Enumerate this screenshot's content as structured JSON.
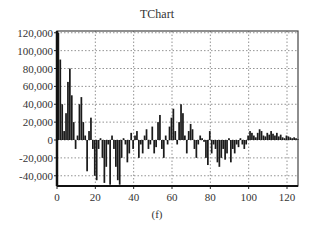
{
  "chart_data": {
    "type": "bar",
    "title": "TChart",
    "caption": "(f)",
    "xlabel": "",
    "ylabel": "",
    "xlim": [
      0,
      126
    ],
    "ylim": [
      -50000,
      120000
    ],
    "x_ticks": [
      0,
      20,
      40,
      60,
      80,
      100,
      120
    ],
    "y_ticks": [
      120000,
      100000,
      80000,
      60000,
      40000,
      20000,
      0,
      -20000,
      -40000
    ],
    "y_tick_labels": [
      "120,000",
      "100,000",
      "80,000",
      "60,000",
      "40,000",
      "20,000",
      "0",
      "-20,000",
      "-40,000"
    ],
    "grid": true,
    "grid_style": "dotted",
    "legend": null,
    "bar_color": "#1a1a1a",
    "x": [
      0,
      1,
      2,
      3,
      4,
      5,
      6,
      7,
      8,
      9,
      10,
      11,
      12,
      13,
      14,
      15,
      16,
      17,
      18,
      19,
      20,
      21,
      22,
      23,
      24,
      25,
      26,
      27,
      28,
      29,
      30,
      31,
      32,
      33,
      34,
      35,
      36,
      37,
      38,
      39,
      40,
      41,
      42,
      43,
      44,
      45,
      46,
      47,
      48,
      49,
      50,
      51,
      52,
      53,
      54,
      55,
      56,
      57,
      58,
      59,
      60,
      61,
      62,
      63,
      64,
      65,
      66,
      67,
      68,
      69,
      70,
      71,
      72,
      73,
      74,
      75,
      76,
      77,
      78,
      79,
      80,
      81,
      82,
      83,
      84,
      85,
      86,
      87,
      88,
      89,
      90,
      91,
      92,
      93,
      94,
      95,
      96,
      97,
      98,
      99,
      100,
      101,
      102,
      103,
      104,
      105,
      106,
      107,
      108,
      109,
      110,
      111,
      112,
      113,
      114,
      115,
      116,
      117,
      118,
      119,
      120,
      121,
      122,
      123,
      124,
      125
    ],
    "values": [
      120000,
      90000,
      40000,
      10000,
      30000,
      65000,
      80000,
      50000,
      20000,
      -10000,
      5000,
      40000,
      48000,
      20000,
      5000,
      -35000,
      10000,
      25000,
      -10000,
      -40000,
      -45000,
      -10000,
      2000,
      -20000,
      -48000,
      -30000,
      -5000,
      -50000,
      5000,
      -10000,
      -30000,
      -45000,
      -50000,
      -20000,
      2000,
      -5000,
      -25000,
      -15000,
      8000,
      -10000,
      5000,
      10000,
      -20000,
      -5000,
      -15000,
      5000,
      12000,
      -10000,
      -5000,
      15000,
      -15000,
      -8000,
      20000,
      28000,
      -10000,
      -20000,
      5000,
      -5000,
      15000,
      25000,
      35000,
      10000,
      -5000,
      20000,
      40000,
      30000,
      5000,
      -15000,
      10000,
      18000,
      12000,
      -10000,
      -20000,
      -5000,
      5000,
      2000,
      -2000,
      -20000,
      -28000,
      10000,
      -15000,
      -5000,
      -10000,
      -25000,
      -30000,
      -20000,
      -10000,
      -22000,
      -15000,
      2000,
      -25000,
      -10000,
      -15000,
      -5000,
      -8000,
      2000,
      -5000,
      -10000,
      -5000,
      5000,
      10000,
      8000,
      5000,
      3000,
      8000,
      12000,
      10000,
      5000,
      4000,
      8000,
      6000,
      10000,
      7000,
      5000,
      8000,
      4000,
      6000,
      3000,
      2000,
      5000,
      4000,
      3000,
      2000,
      3000,
      2000,
      1000
    ]
  }
}
